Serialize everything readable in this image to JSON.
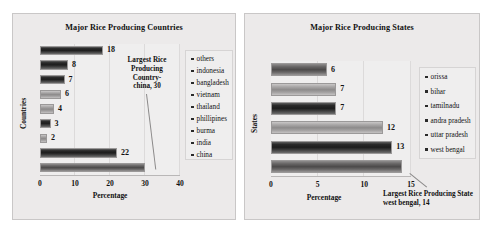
{
  "charts": [
    {
      "id": "countries",
      "title": "Major Rice Producing Countries",
      "xlabel": "Percentage",
      "ylabel": "Countries",
      "ticks": [
        "0",
        "10",
        "20",
        "30",
        "40"
      ],
      "annotation": "Largest Rice Producing Country- china, 30",
      "annotation_lines": [
        "Largest Rice",
        "Producing",
        "Country-",
        "china, 30"
      ],
      "legend": [
        "others",
        "indonesia",
        "bangladesh",
        "vietnam",
        "thailand",
        "phillipines",
        "burma",
        "india",
        "china"
      ],
      "bars": [
        {
          "label": "others",
          "value": 18,
          "display": "18",
          "shade": "dark"
        },
        {
          "label": "indonesia",
          "value": 8,
          "display": "8",
          "shade": "dark"
        },
        {
          "label": "bangladesh",
          "value": 7,
          "display": "7",
          "shade": "dark"
        },
        {
          "label": "vietnam",
          "value": 6,
          "display": "6",
          "shade": "light"
        },
        {
          "label": "thailand",
          "value": 4,
          "display": "4",
          "shade": "light"
        },
        {
          "label": "phillipines",
          "value": 3,
          "display": "3",
          "shade": "dark"
        },
        {
          "label": "burma",
          "value": 2,
          "display": "2",
          "shade": "light"
        },
        {
          "label": "india",
          "value": 22,
          "display": "22",
          "shade": "dark"
        },
        {
          "label": "china",
          "value": 30,
          "display": "",
          "shade": "mid"
        }
      ]
    },
    {
      "id": "states",
      "title": "Major Rice Producing States",
      "xlabel": "Percentage",
      "ylabel": "States",
      "ticks": [
        "0",
        "5",
        "10",
        "15"
      ],
      "annotation": "Largest Rice Producing State west bengal, 14",
      "annotation_lines": [
        "Largest Rice Producing State",
        "west bengal, 14"
      ],
      "legend": [
        "orissa",
        "bihar",
        "tamilnadu",
        "andra pradesh",
        "uttar pradesh",
        "west bengal"
      ],
      "bars": [
        {
          "label": "orissa",
          "value": 6,
          "display": "6",
          "shade": "mid"
        },
        {
          "label": "bihar",
          "value": 7,
          "display": "7",
          "shade": "light"
        },
        {
          "label": "tamilnadu",
          "value": 7,
          "display": "7",
          "shade": "dark"
        },
        {
          "label": "andra pradesh",
          "value": 12,
          "display": "12",
          "shade": "light"
        },
        {
          "label": "uttar pradesh",
          "value": 13,
          "display": "13",
          "shade": "dark"
        },
        {
          "label": "west bengal",
          "value": 14,
          "display": "",
          "shade": "mid"
        }
      ]
    }
  ],
  "chart_data": [
    {
      "type": "bar",
      "orientation": "horizontal",
      "title": "Major Rice Producing Countries",
      "xlabel": "Percentage",
      "ylabel": "Countries",
      "categories": [
        "others",
        "indonesia",
        "bangladesh",
        "vietnam",
        "thailand",
        "phillipines",
        "burma",
        "india",
        "china"
      ],
      "values": [
        18,
        8,
        7,
        6,
        4,
        3,
        2,
        22,
        30
      ],
      "xlim": [
        0,
        40
      ],
      "xticks": [
        0,
        10,
        20,
        30,
        40
      ],
      "grid": true,
      "legend_position": "right",
      "data_labels": [
        "18",
        "8",
        "7",
        "6",
        "4",
        "3",
        "2",
        "22",
        ""
      ],
      "annotations": [
        "Largest Rice Producing Country- china, 30"
      ]
    },
    {
      "type": "bar",
      "orientation": "horizontal",
      "title": "Major Rice Producing States",
      "xlabel": "Percentage",
      "ylabel": "States",
      "categories": [
        "orissa",
        "bihar",
        "tamilnadu",
        "andra pradesh",
        "uttar pradesh",
        "west bengal"
      ],
      "values": [
        6,
        7,
        7,
        12,
        13,
        14
      ],
      "xlim": [
        0,
        15
      ],
      "xticks": [
        0,
        5,
        10,
        15
      ],
      "grid": true,
      "legend_position": "right",
      "data_labels": [
        "6",
        "7",
        "7",
        "12",
        "13",
        ""
      ],
      "annotations": [
        "Largest Rice Producing State west bengal, 14"
      ]
    }
  ]
}
